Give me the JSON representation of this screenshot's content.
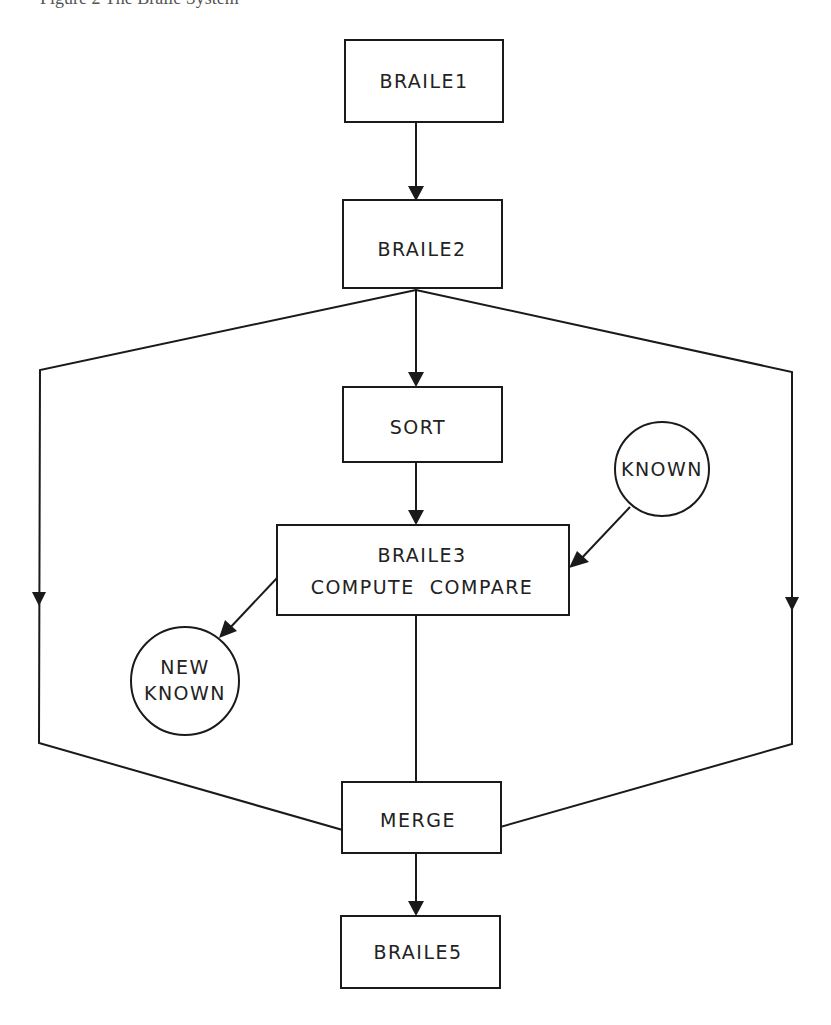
{
  "caption": "Figure 2  The Braile System",
  "colors": {
    "stroke": "#1a1a1a",
    "text": "#222222",
    "background": "#ffffff"
  },
  "nodes": {
    "braile1": {
      "shape": "box",
      "lines": [
        "BRAILE1"
      ]
    },
    "braile2": {
      "shape": "box",
      "lines": [
        "BRAILE2"
      ]
    },
    "sort": {
      "shape": "box",
      "lines": [
        "SORT"
      ]
    },
    "known": {
      "shape": "circle",
      "lines": [
        "KNOWN"
      ]
    },
    "braile3": {
      "shape": "box",
      "lines": [
        "BRAILE3",
        "COMPUTE  COMPARE"
      ]
    },
    "new_known": {
      "shape": "circle",
      "lines": [
        "NEW",
        "KNOWN"
      ]
    },
    "merge": {
      "shape": "box",
      "lines": [
        "MERGE"
      ]
    },
    "braile5": {
      "shape": "box",
      "lines": [
        "BRAILE5"
      ]
    }
  },
  "edges": [
    {
      "from": "BRAILE1",
      "to": "BRAILE2"
    },
    {
      "from": "BRAILE2",
      "to": "SORT"
    },
    {
      "from": "BRAILE2",
      "to": "MERGE",
      "route": "left bypass"
    },
    {
      "from": "BRAILE2",
      "to": "MERGE",
      "route": "right bypass"
    },
    {
      "from": "SORT",
      "to": "BRAILE3"
    },
    {
      "from": "KNOWN",
      "to": "BRAILE3"
    },
    {
      "from": "BRAILE3",
      "to": "NEW KNOWN"
    },
    {
      "from": "BRAILE3",
      "to": "MERGE"
    },
    {
      "from": "MERGE",
      "to": "BRAILE5"
    }
  ]
}
